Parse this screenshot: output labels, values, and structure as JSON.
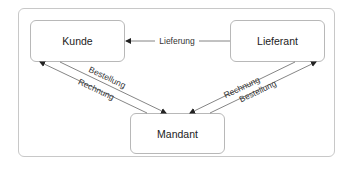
{
  "diagram": {
    "nodes": {
      "kunde": "Kunde",
      "lieferant": "Lieferant",
      "mandant": "Mandant"
    },
    "edges": {
      "lieferung": "Lieferung",
      "kunde_mandant_bestellung": "Bestellung",
      "mandant_kunde_rechnung": "Rechnung",
      "lieferant_mandant_rechnung": "Rechnung",
      "mandant_lieferant_bestellung": "Bestellung"
    }
  }
}
